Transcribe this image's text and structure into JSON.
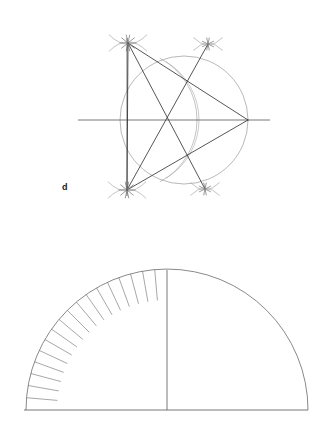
{
  "page": {
    "background_color": "#ffffff",
    "width": 329,
    "height": 433
  },
  "styles": {
    "ink_dark": "#2b2b2b",
    "ink_mid": "#555555",
    "ink_light": "#8a8a8a",
    "stroke_width_main": 0.8,
    "stroke_width_light": 0.6
  },
  "figures": [
    {
      "id": "figure-d",
      "name": "pentagon-construction",
      "label": "d",
      "label_x": 62,
      "label_y": 190,
      "description": "Compass and straightedge construction of a regular pentagon inscribed in a circle, with arc intersection marks at the vertices.",
      "circle": {
        "cx": 184,
        "cy": 120,
        "r": 64,
        "color": "#8a8a8a"
      },
      "diameter_line": {
        "x1": 78,
        "y1": 120,
        "x2": 270,
        "y2": 120,
        "color": "#555555"
      },
      "vertical_chord": {
        "x": 127,
        "y1": 38,
        "y2": 196,
        "color": "#555555"
      },
      "secondary_arc": {
        "description": "construction arc swung from the left chord point through the circle interior",
        "cx": 127,
        "cy": 120,
        "r": 70,
        "start_deg": -62,
        "end_deg": 62,
        "color": "#9a9a9a"
      },
      "vertices": [
        {
          "name": "vertex-top-left",
          "x": 128,
          "y": 43,
          "on_circle": true
        },
        {
          "name": "vertex-right",
          "x": 248,
          "y": 120,
          "on_circle": true
        },
        {
          "name": "vertex-bottom-left",
          "x": 127,
          "y": 190,
          "on_circle": true
        },
        {
          "name": "vertex-top-right",
          "x": 208,
          "y": 44,
          "on_circle": true
        },
        {
          "name": "vertex-bottom-right",
          "x": 205,
          "y": 189,
          "on_circle": true
        },
        {
          "name": "center-point",
          "x": 184,
          "y": 120,
          "on_circle": false
        }
      ],
      "arc_cross_marks": [
        {
          "name": "cross-mark-top-left",
          "x": 128,
          "y": 43,
          "size": 17,
          "strokes": 5
        },
        {
          "name": "cross-mark-top-right",
          "x": 208,
          "y": 44,
          "size": 13,
          "strokes": 4
        },
        {
          "name": "cross-mark-bottom-left",
          "x": 127,
          "y": 190,
          "size": 17,
          "strokes": 5
        },
        {
          "name": "cross-mark-bottom-right",
          "x": 205,
          "y": 189,
          "size": 13,
          "strokes": 4
        }
      ],
      "chords": [
        {
          "name": "chord-topleft-to-right",
          "x1": 128,
          "y1": 43,
          "x2": 248,
          "y2": 120
        },
        {
          "name": "chord-topleft-to-bottomright",
          "x1": 128,
          "y1": 43,
          "x2": 205,
          "y2": 189
        },
        {
          "name": "chord-topleft-to-bottomleft",
          "x1": 128,
          "y1": 43,
          "x2": 127,
          "y2": 190
        },
        {
          "name": "chord-bottomleft-to-right",
          "x1": 127,
          "y1": 190,
          "x2": 248,
          "y2": 120
        },
        {
          "name": "chord-bottomleft-to-topright",
          "x1": 127,
          "y1": 190,
          "x2": 208,
          "y2": 44
        }
      ]
    },
    {
      "id": "figure-semicircle",
      "name": "divided-semicircle",
      "description": "Semicircle on a horizontal baseline with a vertical radius at the apex; the left quadrant is subdivided by radial tick marks near the rim.",
      "center": {
        "x": 167,
        "y": 410
      },
      "radius": 141,
      "baseline": {
        "x1": 24,
        "y1": 410,
        "x2": 308,
        "y2": 410,
        "color": "#555555"
      },
      "vertical_radius": {
        "x1": 167,
        "y1": 270,
        "x2": 167,
        "y2": 410,
        "color": "#555555"
      },
      "arc_color": "#6b6b6b",
      "tick_marks": {
        "count": 17,
        "quadrant": "left",
        "start_angle_deg": 90,
        "end_angle_deg": 180,
        "inner_radius_ratio": 0.78,
        "outer_radius_ratio": 1.0,
        "color": "#6b6b6b"
      }
    }
  ]
}
